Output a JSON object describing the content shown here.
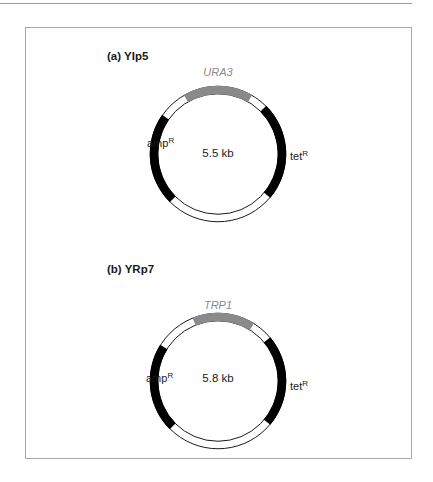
{
  "figure": {
    "colors": {
      "marker": "#000000",
      "selectable_gene": "#8a8a8a",
      "backbone": "#ffffff",
      "outline": "#1a1a1a",
      "frame": "#a8a8a8"
    },
    "panels": [
      {
        "id": "a",
        "title": "(a)  YIp5",
        "size_label": "5.5 kb",
        "gene_label": "URA3",
        "left_marker": {
          "base": "amp",
          "sup": "R"
        },
        "right_marker": {
          "base": "tet",
          "sup": "R"
        },
        "segments": [
          {
            "name": "URA3",
            "type": "gene",
            "start_deg": -120,
            "end_deg": -60
          },
          {
            "name": "spacer",
            "type": "backbone",
            "start_deg": -60,
            "end_deg": -45
          },
          {
            "name": "tetR",
            "type": "marker",
            "start_deg": -45,
            "end_deg": 40
          },
          {
            "name": "spacer",
            "type": "backbone",
            "start_deg": 40,
            "end_deg": 135
          },
          {
            "name": "ampR",
            "type": "marker",
            "start_deg": 135,
            "end_deg": 215
          },
          {
            "name": "spacer",
            "type": "backbone",
            "start_deg": 215,
            "end_deg": 240
          }
        ]
      },
      {
        "id": "b",
        "title": "(b)  YRp7",
        "size_label": "5.8 kb",
        "gene_label": "TRP1",
        "left_marker": {
          "base": "amp",
          "sup": "R"
        },
        "right_marker": {
          "base": "tet",
          "sup": "R"
        },
        "segments": [
          {
            "name": "TRP1",
            "type": "gene",
            "start_deg": -112,
            "end_deg": -58
          },
          {
            "name": "spacer",
            "type": "backbone",
            "start_deg": -58,
            "end_deg": -40
          },
          {
            "name": "tetR",
            "type": "marker",
            "start_deg": -40,
            "end_deg": 40
          },
          {
            "name": "spacer",
            "type": "backbone",
            "start_deg": 40,
            "end_deg": 135
          },
          {
            "name": "ampR",
            "type": "marker",
            "start_deg": 135,
            "end_deg": 212
          },
          {
            "name": "spacer",
            "type": "backbone",
            "start_deg": 212,
            "end_deg": 248
          }
        ]
      }
    ]
  }
}
